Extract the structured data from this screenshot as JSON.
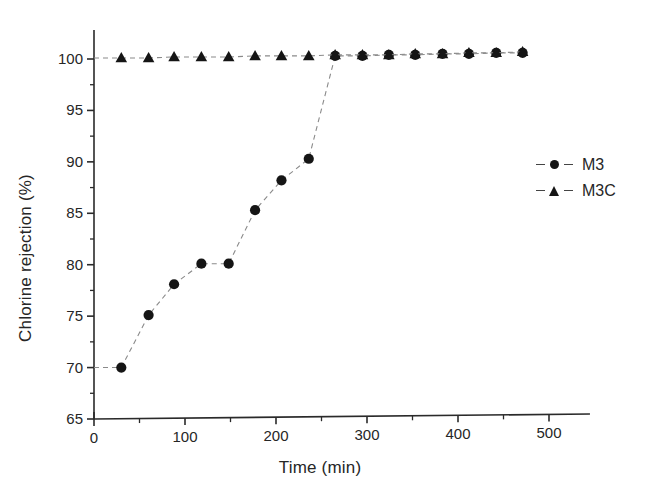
{
  "chart_data": {
    "type": "scatter",
    "title": "",
    "xlabel": "Time (min)",
    "ylabel": "Chlorine rejection (%)",
    "xlim": [
      0,
      545
    ],
    "ylim": [
      65,
      101.5
    ],
    "xticks": [
      0,
      100,
      200,
      300,
      400,
      500
    ],
    "xtick_labels": [
      "0",
      "100",
      "200",
      "300",
      "400",
      "500"
    ],
    "xminor_interval": 50,
    "yticks": [
      65,
      70,
      75,
      80,
      85,
      90,
      95,
      100
    ],
    "ytick_labels": [
      "65",
      "70",
      "75",
      "80",
      "85",
      "90",
      "95",
      "100"
    ],
    "yminor_interval": 2.5,
    "grid": false,
    "legend_position": "right",
    "series": [
      {
        "name": "M3",
        "marker": "circle",
        "linestyle": "dashed",
        "color": "#151515",
        "x": [
          30,
          60,
          88,
          118,
          148,
          177,
          206,
          236,
          265,
          295,
          324,
          353,
          383,
          412,
          442,
          471
        ],
        "y": [
          70.0,
          75.1,
          78.1,
          80.1,
          80.1,
          85.3,
          88.2,
          90.3,
          100.3,
          100.3,
          100.4,
          100.4,
          100.5,
          100.5,
          100.6,
          100.6
        ]
      },
      {
        "name": "M3C",
        "marker": "triangle",
        "linestyle": "dashed",
        "color": "#151515",
        "x": [
          30,
          60,
          88,
          118,
          148,
          177,
          206,
          236,
          265,
          295,
          324,
          353,
          383,
          412,
          442,
          471
        ],
        "y": [
          100.1,
          100.1,
          100.2,
          100.2,
          100.2,
          100.3,
          100.3,
          100.3,
          100.4,
          100.4,
          100.4,
          100.5,
          100.5,
          100.6,
          100.6,
          100.7
        ]
      }
    ]
  },
  "legend": {
    "entries": [
      {
        "label": "M3",
        "marker": "circle"
      },
      {
        "label": "M3C",
        "marker": "triangle"
      }
    ]
  }
}
